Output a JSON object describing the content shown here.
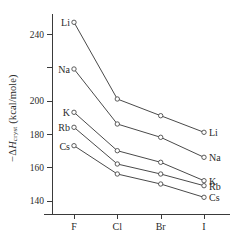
{
  "chart_data": {
    "type": "line",
    "title": "",
    "xlabel": "",
    "ylabel": "−ΔH cryst (kcal/mole)",
    "ylabel_parts": {
      "prefix": "−Δ",
      "italic": "H",
      "subscript": "cryst",
      "units": " (kcal/mole)"
    },
    "categories": [
      "F",
      "Cl",
      "Br",
      "I"
    ],
    "ylim": [
      132,
      252
    ],
    "yticks": [
      140,
      160,
      180,
      200,
      220,
      240
    ],
    "ytick_labels": [
      "140",
      "160",
      "180",
      "200",
      "",
      "240"
    ],
    "grid": false,
    "legend_position": "inline-endpoints",
    "series": [
      {
        "name": "Li",
        "left_label": "Li",
        "right_label": "Li",
        "values": [
          247,
          201,
          191,
          181
        ]
      },
      {
        "name": "Na",
        "left_label": "Na",
        "right_label": "Na",
        "values": [
          219,
          186,
          178,
          166
        ]
      },
      {
        "name": "K",
        "left_label": "K",
        "right_label": "K",
        "values": [
          193,
          170,
          163,
          152
        ]
      },
      {
        "name": "Rb",
        "left_label": "Rb",
        "right_label": "Rb",
        "values": [
          184,
          162,
          156,
          149
        ]
      },
      {
        "name": "Cs",
        "left_label": "Cs",
        "right_label": "Cs",
        "values": [
          173,
          156,
          150,
          142
        ]
      }
    ]
  },
  "style": {
    "line_color": "#4a4a4a",
    "axis_color": "#3a3a3a",
    "text_color": "#2b2b2b",
    "marker_fill": "#ffffff",
    "background": "#ffffff"
  }
}
